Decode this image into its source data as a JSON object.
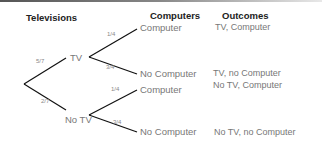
{
  "headers": {
    "televisions": "Televisions",
    "computers": "Computers",
    "outcomes": "Outcomes"
  },
  "tree": {
    "level1": [
      {
        "label": "TV",
        "probability": "5/7"
      },
      {
        "label": "No TV",
        "probability": "2/7"
      }
    ],
    "level2": [
      {
        "parent": "TV",
        "label": "Computer",
        "probability": "1/4",
        "outcome": "TV, Computer"
      },
      {
        "parent": "TV",
        "label": "No Computer",
        "probability": "3/4",
        "outcome": "TV, no Computer"
      },
      {
        "parent": "No TV",
        "label": "Computer",
        "probability": "1/4",
        "outcome": "No TV, Computer"
      },
      {
        "parent": "No TV",
        "label": "No Computer",
        "probability": "3/4",
        "outcome": "No TV, no Computer"
      }
    ]
  }
}
